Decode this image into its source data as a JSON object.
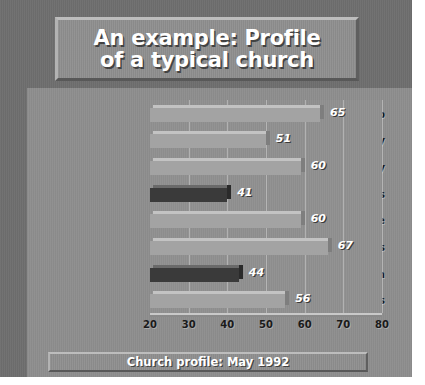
{
  "slide": {
    "title": "An example: Profile\nof a typical church",
    "footer": "Church profile: May 1992"
  },
  "colors": {
    "slide_background": "#8d8d8d",
    "band": "#6e6e6e",
    "plaque": "#8e8e8e",
    "plot_background": "#909090",
    "bar_normal": "#a3a3a3",
    "bar_highlight": "#3a3a3a",
    "value_label": "#ffffff",
    "category_label": "#161616"
  },
  "chart_data": {
    "type": "bar",
    "orientation": "horizontal",
    "title": "An example: Profile of a typical church",
    "subtitle": "Church profile: May 1992",
    "xlabel": "",
    "ylabel": "",
    "xlim": [
      20,
      80
    ],
    "xticks": [
      20,
      30,
      40,
      50,
      60,
      70,
      80
    ],
    "grid": true,
    "grid_axis": "x",
    "legend": false,
    "categories": [
      "Leadership",
      "Ministry",
      "Spirituality",
      "Structures",
      "Worship service",
      "Small groups",
      "Evangelism",
      "Relationships"
    ],
    "values": [
      65,
      51,
      60,
      41,
      60,
      67,
      44,
      56
    ],
    "highlighted": [
      false,
      false,
      false,
      true,
      false,
      false,
      true,
      false
    ],
    "bars": [
      {
        "category": "Leadership",
        "value": 65,
        "label": "65",
        "highlighted": false
      },
      {
        "category": "Ministry",
        "value": 51,
        "label": "51",
        "highlighted": false
      },
      {
        "category": "Spirituality",
        "value": 60,
        "label": "60",
        "highlighted": false
      },
      {
        "category": "Structures",
        "value": 41,
        "label": "41",
        "highlighted": true
      },
      {
        "category": "Worship service",
        "value": 60,
        "label": "60",
        "highlighted": false
      },
      {
        "category": "Small groups",
        "value": 67,
        "label": "67",
        "highlighted": false
      },
      {
        "category": "Evangelism",
        "value": 44,
        "label": "44",
        "highlighted": true
      },
      {
        "category": "Relationships",
        "value": 56,
        "label": "56",
        "highlighted": false
      }
    ]
  }
}
